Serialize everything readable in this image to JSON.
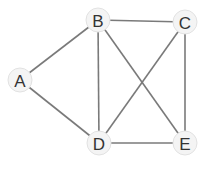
{
  "graph": {
    "nodes": [
      {
        "id": "A",
        "label": "A",
        "x": 20,
        "y": 80
      },
      {
        "id": "B",
        "label": "B",
        "x": 98,
        "y": 20
      },
      {
        "id": "C",
        "label": "C",
        "x": 185,
        "y": 22
      },
      {
        "id": "D",
        "label": "D",
        "x": 99,
        "y": 143
      },
      {
        "id": "E",
        "label": "E",
        "x": 185,
        "y": 143
      }
    ],
    "edges": [
      {
        "from": "A",
        "to": "B"
      },
      {
        "from": "A",
        "to": "D"
      },
      {
        "from": "B",
        "to": "C"
      },
      {
        "from": "B",
        "to": "D"
      },
      {
        "from": "B",
        "to": "E"
      },
      {
        "from": "C",
        "to": "D"
      },
      {
        "from": "C",
        "to": "E"
      },
      {
        "from": "D",
        "to": "E"
      }
    ],
    "colors": {
      "edge": "#7a7a7a",
      "node_fill": "#f4f4f4",
      "label": "#333333"
    }
  }
}
